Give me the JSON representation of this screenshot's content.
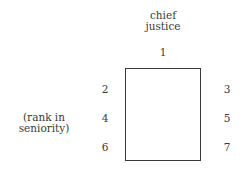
{
  "diagram": {
    "title_line1": "chief",
    "title_line2": "justice",
    "chief_rank": "1",
    "left_ranks": [
      "2",
      "4",
      "6"
    ],
    "right_ranks": [
      "3",
      "5",
      "7"
    ],
    "note_line1": "(rank in",
    "note_line2": "seniority)"
  }
}
